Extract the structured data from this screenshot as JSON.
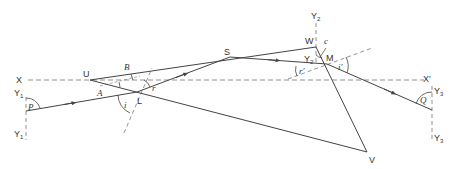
{
  "diagram": {
    "type": "prism-refraction-geometry",
    "colors": {
      "line": "#444444",
      "dashed": "#777777",
      "text": "#333333",
      "background": "#ffffff"
    },
    "points": {
      "X": {
        "label": "X"
      },
      "X_prime": {
        "label": "X",
        "prime": "′"
      },
      "U": {
        "label": "U"
      },
      "B": {
        "label": "B"
      },
      "A": {
        "label": "A"
      },
      "L": {
        "label": "L"
      },
      "S": {
        "label": "S"
      },
      "W": {
        "label": "W"
      },
      "M": {
        "label": "M"
      },
      "V": {
        "label": "V"
      },
      "c": {
        "label": "c"
      }
    },
    "axes": {
      "Y1_top": {
        "label": "Y",
        "sub": "1"
      },
      "Y1_bottom": {
        "label": "Y",
        "sub": "1"
      },
      "Y2_top": {
        "label": "Y",
        "sub": "2"
      },
      "Y2_mid": {
        "label": "Y",
        "sub": "2"
      },
      "Y3_top": {
        "label": "Y",
        "sub": "3"
      },
      "Y3_bottom": {
        "label": "Y",
        "sub": "3"
      }
    },
    "angles": {
      "P": "P",
      "i": "i",
      "r": "r",
      "r_prime": "r′",
      "i_prime": "i′",
      "Q": "Q"
    }
  }
}
